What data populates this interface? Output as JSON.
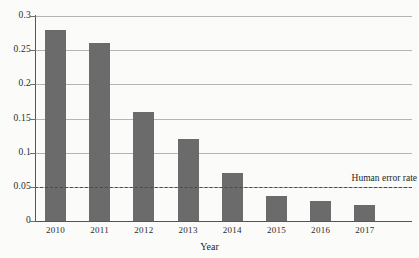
{
  "chart_data": {
    "type": "bar",
    "title": "",
    "xlabel": "Year",
    "ylabel": "",
    "categories": [
      "2010",
      "2011",
      "2012",
      "2013",
      "2014",
      "2015",
      "2016",
      "2017"
    ],
    "values": [
      0.28,
      0.26,
      0.16,
      0.12,
      0.07,
      0.037,
      0.03,
      0.023
    ],
    "ylim": [
      0,
      0.3
    ],
    "yticks": [
      0,
      0.05,
      0.1,
      0.15,
      0.2,
      0.25,
      0.3
    ],
    "ytick_labels": [
      "0",
      "0.05",
      "0.1",
      "0.15",
      "0.2",
      "0.25",
      "0.3"
    ],
    "grid": true,
    "legend": "none",
    "annotations": [
      {
        "kind": "threshold-line",
        "label": "Human error rate",
        "value": 0.05,
        "style": "dashed",
        "label_position": "above-right"
      }
    ],
    "colors": {
      "bar": "#6b6b6b",
      "gridline": "#b4b4b4",
      "axis": "#555555",
      "threshold": "#4a4a4a",
      "background": "#fbfbfa",
      "text": "#1f1f1f"
    }
  }
}
